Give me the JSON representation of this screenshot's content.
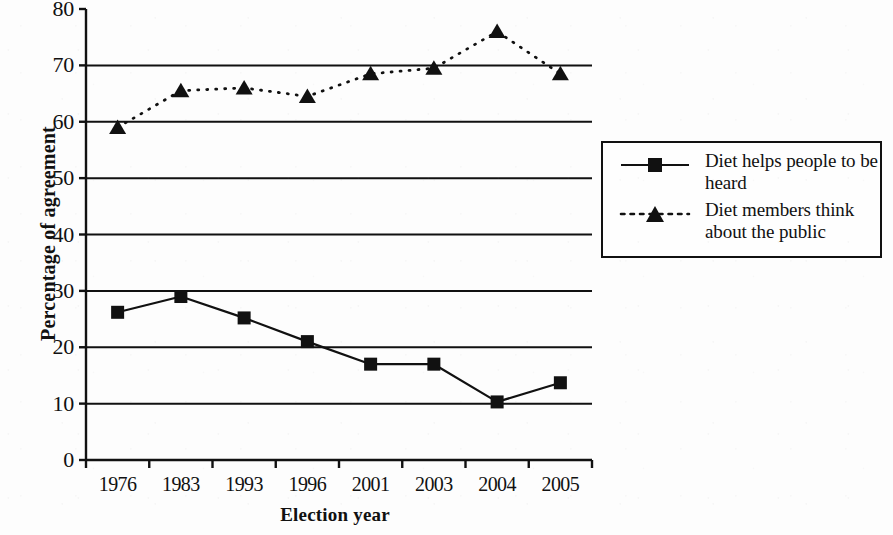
{
  "chart_data": {
    "type": "line",
    "title": "",
    "xlabel": "Election year",
    "ylabel": "Percentage of agreement",
    "categories": [
      "1976",
      "1983",
      "1993",
      "1996",
      "2001",
      "2003",
      "2004",
      "2005"
    ],
    "ylim": [
      0,
      80
    ],
    "ytick_step": 10,
    "yticks": [
      "80",
      "70",
      "60",
      "50",
      "40",
      "30",
      "20",
      "10",
      "0"
    ],
    "grid": "horizontal",
    "legend_position": "right",
    "series": [
      {
        "name": "Diet helps people to be heard",
        "marker": "square",
        "linestyle": "solid",
        "color": "#111111",
        "values": [
          26.2,
          29.0,
          25.2,
          21.0,
          17.0,
          17.0,
          10.3,
          13.7
        ]
      },
      {
        "name": "Diet members think about the public",
        "marker": "triangle",
        "linestyle": "dotted",
        "color": "#111111",
        "values": [
          59.0,
          65.5,
          66.0,
          64.5,
          68.5,
          69.5,
          76.0,
          68.5
        ]
      }
    ]
  },
  "legend": {
    "entries": [
      {
        "label": "Diet helps people to be heard"
      },
      {
        "label": "Diet members think about the public"
      }
    ]
  },
  "axes": {
    "y_title": "Percentage of agreement",
    "x_title": "Election year"
  }
}
